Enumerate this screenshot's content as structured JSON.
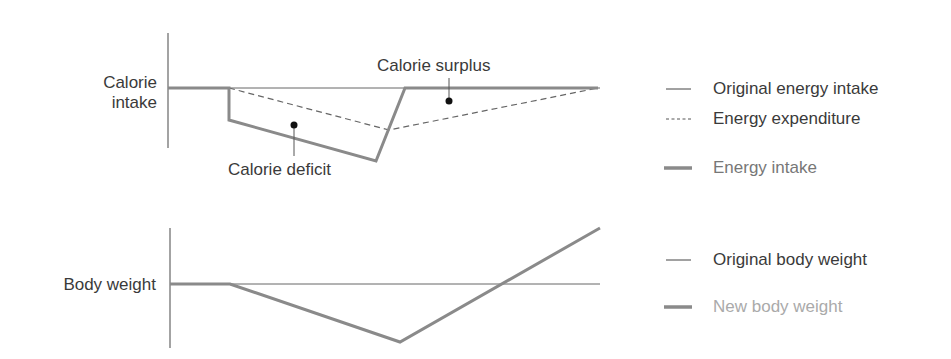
{
  "top_chart": {
    "y_label_line1": "Calorie",
    "y_label_line2": "intake",
    "annotations": {
      "surplus": "Calorie surplus",
      "deficit": "Calorie deficit"
    }
  },
  "bottom_chart": {
    "y_label": "Body weight"
  },
  "legend_top": [
    {
      "label": "Original energy intake",
      "style": "thin-solid",
      "color": "#3a3a3a"
    },
    {
      "label": "Energy expenditure",
      "style": "dashed",
      "color": "#3a3a3a"
    },
    {
      "label": "Energy intake",
      "style": "thick-solid",
      "color": "#777777"
    }
  ],
  "legend_bottom": [
    {
      "label": "Original body weight",
      "style": "thin-solid",
      "color": "#3a3a3a"
    },
    {
      "label": "New body weight",
      "style": "thick-solid",
      "color": "#aaaaaa"
    }
  ],
  "colors": {
    "thin_line": "#555555",
    "thick_line": "#8a8a8a",
    "text": "#3a3a3a"
  }
}
